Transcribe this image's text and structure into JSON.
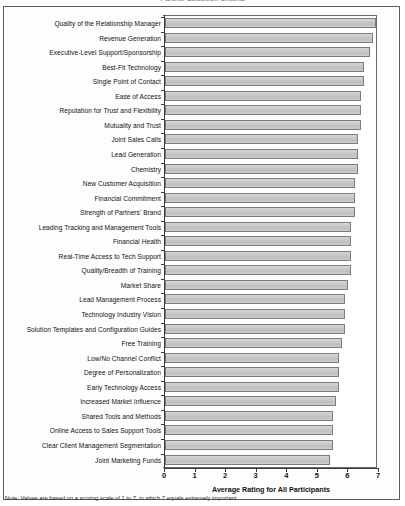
{
  "title_strip": {
    "text": "Partner Selection Criteria"
  },
  "note": {
    "text": "Note: Values are based on a scoring scale of 1 to 7, in which 7 equals extremely important."
  },
  "axis": {
    "x_title": "Average Rating for All Participants",
    "x_ticks": [
      "0",
      "1",
      "2",
      "3",
      "4",
      "5",
      "6",
      "7"
    ]
  },
  "colors": {
    "bar_fill": "#c9c9c9",
    "bar_border": "#7c7c7c",
    "axis": "#3a3a3a",
    "frame": "#5d5d5d",
    "text": "#111111"
  },
  "chart_data": {
    "type": "bar",
    "orientation": "horizontal",
    "title": "Partner Selection Criteria",
    "xlabel": "Average Rating for All Participants",
    "ylabel": "",
    "xlim": [
      0,
      7
    ],
    "grid": false,
    "legend": false,
    "note": "Note: Values are based on a scoring scale of 1 to 7, in which 7 equals extremely important.",
    "categories": [
      "Quality of the Relationship Manager",
      "Revenue Generation",
      "Executive-Level Support/Sponsorship",
      "Best-Fit Technology",
      "Single Point of Contact",
      "Ease of Access",
      "Reputation for Trust and Flexibility",
      "Mutuality and Trust",
      "Joint Sales Calls",
      "Lead Generation",
      "Chemistry",
      "New Customer Acquisition",
      "Financial Commitment",
      "Strength of Partners' Brand",
      "Leading Tracking and Management Tools",
      "Financial Health",
      "Real-Time Access to Tech Support",
      "Quality/Breadth of Training",
      "Market Share",
      "Lead Management Process",
      "Technology Industry Vision",
      "Solution Templates and Configuration Guides",
      "Free Training",
      "Low/No Channel Conflict",
      "Degree of Personalization",
      "Early Technology Access",
      "Increased Market Influence",
      "Shared Tools and Methods",
      "Online Access to Sales Support Tools",
      "Clear Client Management Segmentation",
      "Joint Marketing Funds"
    ],
    "values": [
      6.9,
      6.8,
      6.7,
      6.5,
      6.5,
      6.4,
      6.4,
      6.4,
      6.3,
      6.3,
      6.3,
      6.2,
      6.2,
      6.2,
      6.1,
      6.1,
      6.1,
      6.1,
      6.0,
      5.9,
      5.9,
      5.9,
      5.8,
      5.7,
      5.7,
      5.7,
      5.6,
      5.5,
      5.5,
      5.5,
      5.4
    ]
  }
}
